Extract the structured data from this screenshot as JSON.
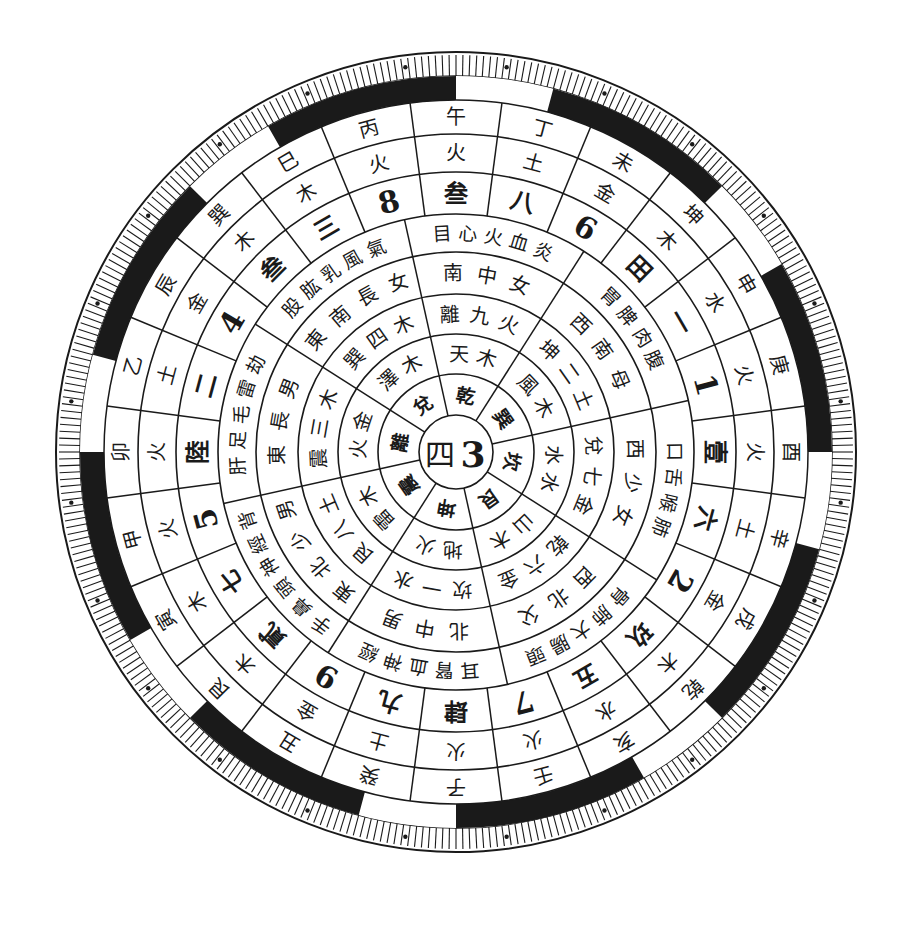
{
  "diagram": {
    "center": {
      "x": 456,
      "y": 452
    },
    "colors": {
      "ink": "#1a1a1a",
      "paper": "#ffffff"
    },
    "radii": {
      "hub": 37,
      "ring1": 78,
      "ring2": 118,
      "ring3": 158,
      "ring4": 200,
      "ring5": 238,
      "mountain_numbers": 280,
      "mountain_elements": 318,
      "mountains": 352,
      "band": 376,
      "ticks_outer": 400
    },
    "hub": {
      "left": "四",
      "right": "3"
    },
    "trigram_sectors": [
      {
        "angle": 100,
        "trigram": "坤",
        "ring2": "地火",
        "ring3": "坎一水",
        "ring4": "北中男",
        "ring5": "耳腎血神經"
      },
      {
        "angle": 55,
        "trigram": "艮",
        "ring2": "山木",
        "ring3": "乾六金",
        "ring4": "西北父",
        "ring5": "骨肺大腸頭"
      },
      {
        "angle": 10,
        "trigram": "坎",
        "ring2": "水水",
        "ring3": "兌七金",
        "ring4": "西少女",
        "ring5": "口舌喉肺"
      },
      {
        "angle": -35,
        "trigram": "巽",
        "ring2": "風木",
        "ring3": "坤二土",
        "ring4": "西南母",
        "ring5": "胃脾肉腹"
      },
      {
        "angle": -80,
        "trigram": "乾",
        "ring2": "天木",
        "ring3": "離九火",
        "ring4": "南中女",
        "ring5": "目心火血炎"
      },
      {
        "angle": -125,
        "trigram": "兌",
        "ring2": "澤木",
        "ring3": "巽四木",
        "ring4": "東南長女",
        "ring5": "股肱乳風氣"
      },
      {
        "angle": 190,
        "trigram": "離",
        "ring2": "火金",
        "ring3": "震三木",
        "ring4": "東長男",
        "ring5": "肝足毛雷劫"
      },
      {
        "angle": 145,
        "trigram": "震",
        "ring2": "雷木",
        "ring3": "艮八土",
        "ring4": "東北少男",
        "ring5": "手鼻頭神經背"
      }
    ],
    "mountains": [
      {
        "name": "子",
        "element": "火",
        "number": "肆"
      },
      {
        "name": "壬",
        "element": "火",
        "number": "7"
      },
      {
        "name": "亥",
        "element": "水",
        "number": "五"
      },
      {
        "name": "乾",
        "element": "木",
        "number": "玖"
      },
      {
        "name": "戌",
        "element": "金",
        "number": "2"
      },
      {
        "name": "辛",
        "element": "土",
        "number": "六"
      },
      {
        "name": "酉",
        "element": "火",
        "number": "壹"
      },
      {
        "name": "庚",
        "element": "火",
        "number": "1"
      },
      {
        "name": "申",
        "element": "水",
        "number": "一"
      },
      {
        "name": "坤",
        "element": "木",
        "number": "田"
      },
      {
        "name": "未",
        "element": "金",
        "number": "6"
      },
      {
        "name": "丁",
        "element": "土",
        "number": "八"
      },
      {
        "name": "午",
        "element": "火",
        "number": "叁"
      },
      {
        "name": "丙",
        "element": "火",
        "number": "8"
      },
      {
        "name": "巳",
        "element": "木",
        "number": "三"
      },
      {
        "name": "巽",
        "element": "木",
        "number": "叁"
      },
      {
        "name": "辰",
        "element": "金",
        "number": "4"
      },
      {
        "name": "乙",
        "element": "土",
        "number": "二"
      },
      {
        "name": "卯",
        "element": "火",
        "number": "陸"
      },
      {
        "name": "甲",
        "element": "火",
        "number": "5"
      },
      {
        "name": "寅",
        "element": "木",
        "number": "七"
      },
      {
        "name": "艮",
        "element": "木",
        "number": "貳"
      },
      {
        "name": "丑",
        "element": "金",
        "number": "9"
      },
      {
        "name": "癸",
        "element": "土",
        "number": "九"
      }
    ],
    "mountain_start_angle": 90,
    "mountain_step": -15,
    "band_black_arcs": [
      [
        60,
        90
      ],
      [
        105,
        135
      ],
      [
        150,
        180
      ],
      [
        195,
        225
      ],
      [
        240,
        270
      ],
      [
        285,
        315
      ],
      [
        330,
        360
      ],
      [
        15,
        45
      ]
    ],
    "tick_count": 360,
    "dot_marks_every": 15
  }
}
